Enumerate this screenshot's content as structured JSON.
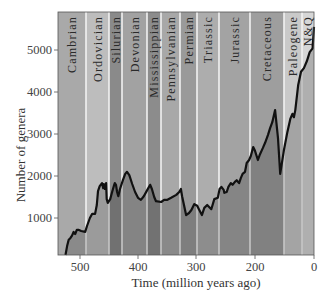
{
  "chart_data": {
    "type": "line",
    "title": "",
    "xlabel": "Time (million years ago)",
    "ylabel": "Number of genera",
    "x_ticks": [
      {
        "label": "500",
        "px": 80
      },
      {
        "label": "400",
        "px": 138
      },
      {
        "label": "300",
        "px": 196
      },
      {
        "label": "200",
        "px": 255
      },
      {
        "label": "0",
        "px": 314
      }
    ],
    "y_ticks": [
      {
        "label": "1000",
        "value": 1000
      },
      {
        "label": "2000",
        "value": 2000
      },
      {
        "label": "3000",
        "value": 3000
      },
      {
        "label": "4000",
        "value": 4000
      },
      {
        "label": "5000",
        "value": 5000
      }
    ],
    "xlim": [
      541,
      0
    ],
    "ylim": [
      0,
      5800
    ],
    "grid": false,
    "legend": null,
    "periods": [
      {
        "name": "Cambrian",
        "x0": 58,
        "x1": 86,
        "color": "#a9a9a9"
      },
      {
        "name": "Ordovician",
        "x0": 86,
        "x1": 109,
        "color": "#bdbdbd"
      },
      {
        "name": "Silurian",
        "x0": 109,
        "x1": 122,
        "color": "#8a8a8a"
      },
      {
        "name": "Devonian",
        "x0": 122,
        "x1": 147,
        "color": "#a2a2a2"
      },
      {
        "name": "Mississippian",
        "x0": 147,
        "x1": 161,
        "color": "#8c8c8c"
      },
      {
        "name": "Pennsylvanian",
        "x0": 161,
        "x1": 180,
        "color": "#a8a8a8"
      },
      {
        "name": "Permian",
        "x0": 180,
        "x1": 197,
        "color": "#9a9a9a"
      },
      {
        "name": "Triassic",
        "x0": 197,
        "x1": 219,
        "color": "#adadad"
      },
      {
        "name": "Jurassic",
        "x0": 219,
        "x1": 250,
        "color": "#a3a3a3"
      },
      {
        "name": "Cretaceous",
        "x0": 250,
        "x1": 284,
        "color": "#9e9e9e"
      },
      {
        "name": "Paleogene",
        "x0": 284,
        "x1": 302,
        "color": "#c9c9c9"
      },
      {
        "name": "N&Q",
        "x0": 302,
        "x1": 314,
        "color": "#d6d6d6"
      }
    ],
    "series": [
      {
        "name": "Number of marine genera",
        "points_ma_genera": [
          [
            527,
            120
          ],
          [
            524,
            330
          ],
          [
            521,
            480
          ],
          [
            518,
            520
          ],
          [
            515,
            580
          ],
          [
            512,
            670
          ],
          [
            509,
            620
          ],
          [
            506,
            720
          ],
          [
            503,
            720
          ],
          [
            498,
            690
          ],
          [
            491,
            670
          ],
          [
            488,
            810
          ],
          [
            483,
            1000
          ],
          [
            479,
            1100
          ],
          [
            474,
            1100
          ],
          [
            471,
            1310
          ],
          [
            469,
            1640
          ],
          [
            466,
            1760
          ],
          [
            462,
            1830
          ],
          [
            460,
            1710
          ],
          [
            459,
            1810
          ],
          [
            457,
            1690
          ],
          [
            455,
            1830
          ],
          [
            454,
            1450
          ],
          [
            452,
            1360
          ],
          [
            448,
            1450
          ],
          [
            445,
            1600
          ],
          [
            441,
            1790
          ],
          [
            440,
            1830
          ],
          [
            438,
            1790
          ],
          [
            436,
            1620
          ],
          [
            434,
            1520
          ],
          [
            431,
            1690
          ],
          [
            426,
            1900
          ],
          [
            422,
            2050
          ],
          [
            419,
            2100
          ],
          [
            415,
            2020
          ],
          [
            410,
            1810
          ],
          [
            405,
            1620
          ],
          [
            400,
            1480
          ],
          [
            395,
            1430
          ],
          [
            390,
            1520
          ],
          [
            384,
            1670
          ],
          [
            379,
            1790
          ],
          [
            376,
            1690
          ],
          [
            372,
            1500
          ],
          [
            369,
            1400
          ],
          [
            360,
            1380
          ],
          [
            355,
            1430
          ],
          [
            350,
            1430
          ],
          [
            343,
            1480
          ],
          [
            334,
            1550
          ],
          [
            329,
            1620
          ],
          [
            326,
            1690
          ],
          [
            324,
            1520
          ],
          [
            320,
            1260
          ],
          [
            317,
            1070
          ],
          [
            312,
            1120
          ],
          [
            308,
            1190
          ],
          [
            303,
            1330
          ],
          [
            298,
            1290
          ],
          [
            295,
            1210
          ],
          [
            290,
            1070
          ],
          [
            286,
            1240
          ],
          [
            281,
            1310
          ],
          [
            274,
            1210
          ],
          [
            269,
            1450
          ],
          [
            263,
            1480
          ],
          [
            260,
            1690
          ],
          [
            257,
            1740
          ],
          [
            253,
            1670
          ],
          [
            252,
            1600
          ],
          [
            248,
            1620
          ],
          [
            245,
            1740
          ],
          [
            241,
            1830
          ],
          [
            238,
            1790
          ],
          [
            234,
            1860
          ],
          [
            231,
            1900
          ],
          [
            227,
            1830
          ],
          [
            224,
            1950
          ],
          [
            221,
            2050
          ],
          [
            217,
            2100
          ],
          [
            214,
            2310
          ],
          [
            210,
            2380
          ],
          [
            207,
            2480
          ],
          [
            203,
            2690
          ],
          [
            200,
            2600
          ],
          [
            196,
            2380
          ],
          [
            193,
            2520
          ],
          [
            189,
            2670
          ],
          [
            186,
            2790
          ],
          [
            182,
            2980
          ],
          [
            179,
            3140
          ],
          [
            176,
            3280
          ],
          [
            172,
            3570
          ],
          [
            168,
            2900
          ],
          [
            165,
            2050
          ],
          [
            160,
            2600
          ],
          [
            155,
            3050
          ],
          [
            151,
            3360
          ],
          [
            148,
            3480
          ],
          [
            146,
            3400
          ],
          [
            144,
            3570
          ],
          [
            140,
            4170
          ],
          [
            136,
            4480
          ],
          [
            132,
            4570
          ],
          [
            128,
            4730
          ],
          [
            124,
            4950
          ],
          [
            120,
            5040
          ],
          [
            118,
            5550
          ]
        ]
      }
    ]
  },
  "labels": {
    "y_axis_title": "Number of genera",
    "x_axis_title": "Time (million years ago)"
  }
}
